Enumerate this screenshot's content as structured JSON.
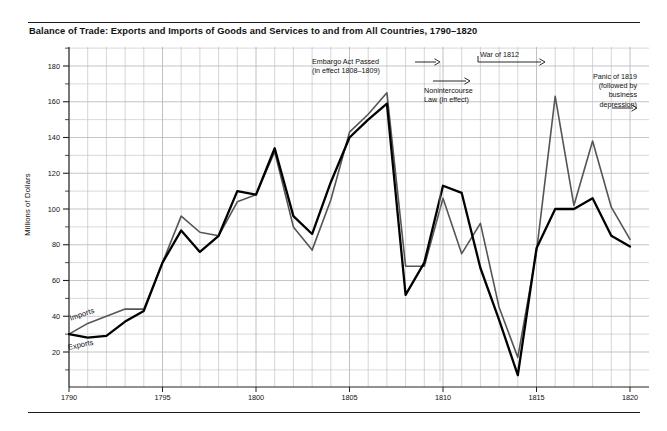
{
  "title": "Balance of Trade: Exports and Imports of Goods and Services  to and from All Countries, 1790–1820",
  "axes": {
    "y_title": "Millions of Dollars",
    "y_ticks": [
      20,
      40,
      60,
      80,
      100,
      120,
      140,
      160,
      180
    ],
    "x_ticks": [
      1790,
      1795,
      1800,
      1805,
      1810,
      1815,
      1820
    ]
  },
  "series_labels": {
    "imports": "Imports",
    "exports": "Exports"
  },
  "annotations": [
    {
      "id": "embargo",
      "lines": [
        "Embargo Act Passed",
        "(in effect 1808–1809)"
      ],
      "align": "left",
      "arrow": "right"
    },
    {
      "id": "nonintercourse",
      "lines": [
        "Nonintercourse",
        "Law (in effect)"
      ],
      "align": "left",
      "arrow": "right"
    },
    {
      "id": "war1812",
      "lines": [
        "War of 1812"
      ],
      "align": "left",
      "arrow": "right"
    },
    {
      "id": "panic",
      "lines": [
        "Panic of 1819",
        "(followed by",
        "business",
        "depression)"
      ],
      "align": "right",
      "arrow": "right"
    }
  ],
  "colors": {
    "exports_line": "#000000",
    "imports_line": "#555555",
    "gridline": "#b9b9bf",
    "axis": "#222222",
    "background": "#ffffff",
    "rule": "#1a1a1a"
  },
  "chart_data": {
    "type": "line",
    "title": "Balance of Trade: Exports and Imports of Goods and Services  to and from All Countries, 1790–1820",
    "xlabel": "",
    "ylabel": "Millions of Dollars",
    "xlim": [
      1790,
      1820
    ],
    "ylim": [
      0,
      190
    ],
    "grid": true,
    "legend": "inline-labels",
    "x": [
      1790,
      1791,
      1792,
      1793,
      1794,
      1795,
      1796,
      1797,
      1798,
      1799,
      1800,
      1801,
      1802,
      1803,
      1804,
      1805,
      1806,
      1807,
      1808,
      1809,
      1810,
      1811,
      1812,
      1813,
      1814,
      1815,
      1816,
      1817,
      1818,
      1819,
      1820
    ],
    "series": [
      {
        "name": "Imports",
        "color": "#555555",
        "values": [
          30,
          36,
          40,
          44,
          44,
          70,
          96,
          87,
          85,
          104,
          108,
          132,
          90,
          77,
          105,
          143,
          153,
          165,
          68,
          68,
          106,
          75,
          92,
          45,
          17,
          76,
          163,
          102,
          138,
          101,
          83
        ]
      },
      {
        "name": "Exports",
        "color": "#000000",
        "values": [
          30,
          28,
          29,
          37,
          43,
          70,
          88,
          76,
          85,
          110,
          108,
          134,
          96,
          86,
          115,
          140,
          150,
          159,
          52,
          70,
          113,
          109,
          67,
          38,
          7,
          78,
          100,
          100,
          106,
          85,
          79
        ]
      }
    ]
  }
}
